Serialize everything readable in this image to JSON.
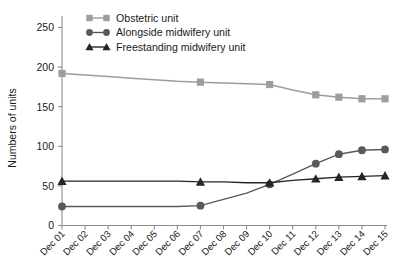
{
  "chart_data": {
    "type": "line",
    "title": "",
    "xlabel": "",
    "ylabel": "Numbers of units",
    "ylim": [
      0,
      260
    ],
    "yticks": [
      0,
      50,
      100,
      150,
      200,
      250
    ],
    "ytick_labels": [
      "0",
      "50",
      "100",
      "150",
      "200",
      "250"
    ],
    "grid": false,
    "legend_position": "top-left",
    "categories": [
      "Dec 01",
      "Dec 02",
      "Dec 03",
      "Dec 04",
      "Dec 05",
      "Dec 06",
      "Dec 07",
      "Dec 08",
      "Dec 09",
      "Dec 10",
      "Dec 11",
      "Dec 12",
      "Dec 13",
      "Dec 14",
      "Dec 15"
    ],
    "series": [
      {
        "name": "Obstetric unit",
        "marker": "square",
        "color": "#9d9d9d",
        "values": [
          192,
          190,
          188,
          186,
          184,
          182,
          181,
          180,
          179,
          178,
          171,
          165,
          162,
          160,
          160
        ],
        "marked_points": [
          "Dec 01",
          "Dec 07",
          "Dec 10",
          "Dec 12",
          "Dec 13",
          "Dec 14",
          "Dec 15"
        ]
      },
      {
        "name": "Alongside midwifery unit",
        "marker": "circle",
        "color": "#595959",
        "values": [
          24,
          24,
          24,
          24,
          24,
          24,
          25,
          33,
          41,
          52,
          65,
          78,
          90,
          95,
          96
        ],
        "marked_points": [
          "Dec 01",
          "Dec 07",
          "Dec 10",
          "Dec 12",
          "Dec 13",
          "Dec 14",
          "Dec 15"
        ]
      },
      {
        "name": "Freestanding midwifery unit",
        "marker": "triangle",
        "color": "#262626",
        "values": [
          56,
          56,
          56,
          56,
          56,
          56,
          55,
          55,
          54,
          54,
          57,
          59,
          61,
          62,
          63
        ],
        "marked_points": [
          "Dec 01",
          "Dec 07",
          "Dec 10",
          "Dec 12",
          "Dec 13",
          "Dec 14",
          "Dec 15"
        ]
      }
    ]
  },
  "legend": {
    "items": [
      {
        "label": "Obstetric unit",
        "marker": "square-marker",
        "color": "#9d9d9d"
      },
      {
        "label": "Alongside midwifery unit",
        "marker": "circle-marker",
        "color": "#595959"
      },
      {
        "label": "Freestanding midwifery unit",
        "marker": "triangle-marker",
        "color": "#262626"
      }
    ]
  },
  "axes": {
    "y_title": "Numbers of units"
  }
}
